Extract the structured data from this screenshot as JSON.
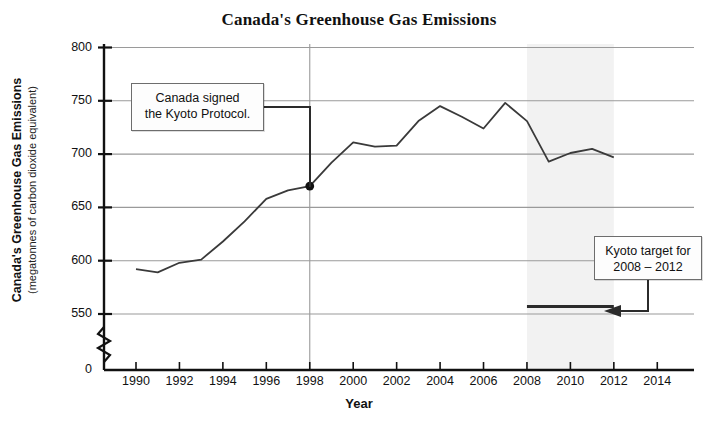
{
  "chart_data": {
    "type": "line",
    "title": "Canada's Greenhouse Gas Emissions",
    "xlabel": "Year",
    "ylabel": "Canada's Greenhouse Gas Emissions",
    "ylabel_sub": "(megatonnes of carbon dioxide equivalent)",
    "xlim": [
      1989,
      2015
    ],
    "ylim": [
      540,
      800
    ],
    "y_axis_break": true,
    "y_axis_break_note": "axis broken between 0 and 550",
    "grid": true,
    "legend": "none",
    "yticks": [
      "800",
      "750",
      "700",
      "650",
      "600",
      "550",
      "0"
    ],
    "ytick_values": [
      800,
      750,
      700,
      650,
      600,
      550,
      0
    ],
    "xticks": [
      "1990",
      "1992",
      "1994",
      "1996",
      "1998",
      "2000",
      "2002",
      "2004",
      "2006",
      "2008",
      "2010",
      "2012",
      "2014"
    ],
    "xtick_values": [
      1990,
      1992,
      1994,
      1996,
      1998,
      2000,
      2002,
      2004,
      2006,
      2008,
      2010,
      2012,
      2014
    ],
    "x": [
      1990,
      1991,
      1992,
      1993,
      1994,
      1995,
      1996,
      1997,
      1998,
      1999,
      2000,
      2001,
      2002,
      2003,
      2004,
      2005,
      2006,
      2007,
      2008,
      2009,
      2010,
      2011,
      2012
    ],
    "values": [
      592,
      589,
      598,
      601,
      618,
      637,
      658,
      666,
      670,
      692,
      711,
      707,
      708,
      731,
      745,
      735,
      724,
      748,
      731,
      693,
      701,
      705,
      697
    ],
    "series": [
      {
        "name": "Canada's greenhouse gas emissions",
        "values": [
          592,
          589,
          598,
          601,
          618,
          637,
          658,
          666,
          670,
          692,
          711,
          707,
          708,
          731,
          745,
          735,
          724,
          748,
          731,
          693,
          701,
          705,
          697
        ]
      }
    ],
    "markers": [
      {
        "name": "kyoto-signing-point",
        "x": 1998,
        "y": 670
      }
    ],
    "reference_lines": [
      {
        "name": "kyoto-target-line",
        "value": 557,
        "x_start": 2008,
        "x_end": 2012
      }
    ],
    "shaded_regions": [
      {
        "name": "kyoto-commitment-period",
        "x_start": 2008,
        "x_end": 2012,
        "color": "#f2f2f2"
      }
    ],
    "annotations": [
      {
        "name": "kyoto-signed-callout",
        "lines": [
          "Canada signed",
          "the Kyoto Protocol."
        ],
        "points_to_x": 1998,
        "points_to_y": 670
      },
      {
        "name": "kyoto-target-callout",
        "lines": [
          "Kyoto target for",
          "2008 – 2012"
        ],
        "points_to_value": 557
      }
    ],
    "colors": {
      "line": "#3a3a3a",
      "grid": "#9a9a9a",
      "axis": "#111111",
      "shaded_band": "#f2f2f2",
      "callout_border": "#6d6d6d",
      "background": "#ffffff"
    }
  }
}
